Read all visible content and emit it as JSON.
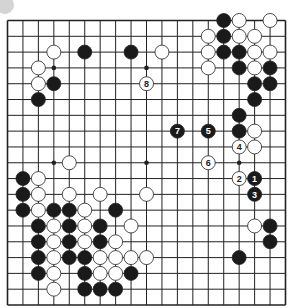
{
  "diagram": {
    "type": "go-board",
    "size": 19,
    "colors": {
      "line": "#222222",
      "black": "#1a1a1a",
      "white": "#ffffff",
      "stone_edge": "#222222",
      "corner_mark": "#d4d4d4"
    },
    "star_points": [
      [
        3,
        3
      ],
      [
        9,
        3
      ],
      [
        15,
        3
      ],
      [
        3,
        9
      ],
      [
        9,
        9
      ],
      [
        15,
        9
      ],
      [
        3,
        15
      ],
      [
        9,
        15
      ],
      [
        15,
        15
      ]
    ],
    "black_stones": [
      [
        14,
        0
      ],
      [
        14,
        1
      ],
      [
        14,
        2
      ],
      [
        15,
        2
      ],
      [
        15,
        3
      ],
      [
        17,
        3
      ],
      [
        16,
        4
      ],
      [
        17,
        4
      ],
      [
        16,
        5
      ],
      [
        15,
        6
      ],
      [
        15,
        7
      ],
      [
        5,
        2
      ],
      [
        8,
        2
      ],
      [
        3,
        4
      ],
      [
        2,
        5
      ],
      [
        1,
        10
      ],
      [
        1,
        11
      ],
      [
        1,
        12
      ],
      [
        3,
        12
      ],
      [
        4,
        12
      ],
      [
        7,
        12
      ],
      [
        2,
        13
      ],
      [
        4,
        13
      ],
      [
        6,
        13
      ],
      [
        2,
        14
      ],
      [
        4,
        14
      ],
      [
        6,
        14
      ],
      [
        2,
        15
      ],
      [
        4,
        15
      ],
      [
        5,
        15
      ],
      [
        2,
        16
      ],
      [
        5,
        16
      ],
      [
        8,
        16
      ],
      [
        5,
        17
      ],
      [
        6,
        17
      ],
      [
        7,
        17
      ],
      [
        17,
        13
      ],
      [
        17,
        14
      ],
      [
        15,
        15
      ]
    ],
    "white_stones": [
      [
        15,
        0
      ],
      [
        17,
        0
      ],
      [
        13,
        1
      ],
      [
        15,
        1
      ],
      [
        16,
        1
      ],
      [
        13,
        2
      ],
      [
        16,
        2
      ],
      [
        17,
        2
      ],
      [
        13,
        3
      ],
      [
        16,
        3
      ],
      [
        16,
        7
      ],
      [
        16,
        8
      ],
      [
        3,
        2
      ],
      [
        10,
        2
      ],
      [
        2,
        3
      ],
      [
        2,
        4
      ],
      [
        4,
        9
      ],
      [
        2,
        10
      ],
      [
        2,
        11
      ],
      [
        4,
        11
      ],
      [
        6,
        11
      ],
      [
        9,
        11
      ],
      [
        2,
        12
      ],
      [
        5,
        12
      ],
      [
        3,
        13
      ],
      [
        5,
        13
      ],
      [
        8,
        13
      ],
      [
        3,
        14
      ],
      [
        5,
        14
      ],
      [
        7,
        14
      ],
      [
        3,
        15
      ],
      [
        6,
        15
      ],
      [
        7,
        15
      ],
      [
        8,
        15
      ],
      [
        9,
        15
      ],
      [
        3,
        16
      ],
      [
        6,
        16
      ],
      [
        7,
        16
      ],
      [
        3,
        17
      ],
      [
        16,
        13
      ]
    ],
    "numbered_moves": [
      {
        "n": "1",
        "color": "black",
        "col": 16,
        "row": 10
      },
      {
        "n": "2",
        "color": "white",
        "col": 15,
        "row": 10
      },
      {
        "n": "3",
        "color": "black",
        "col": 16,
        "row": 11
      },
      {
        "n": "4",
        "color": "white",
        "col": 15,
        "row": 8
      },
      {
        "n": "5",
        "color": "black",
        "col": 13,
        "row": 7
      },
      {
        "n": "6",
        "color": "white",
        "col": 13,
        "row": 9
      },
      {
        "n": "7",
        "color": "black",
        "col": 11,
        "row": 7
      },
      {
        "n": "8",
        "color": "white",
        "col": 9,
        "row": 4
      }
    ]
  }
}
